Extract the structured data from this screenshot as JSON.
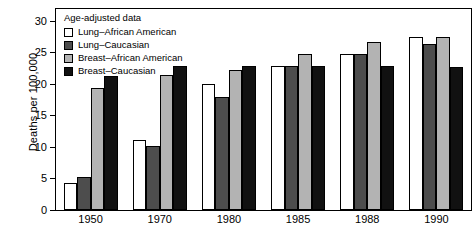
{
  "chart_data": {
    "type": "bar",
    "title": "",
    "xlabel": "",
    "ylabel": "Deaths per 100,000",
    "ylim": [
      0,
      32
    ],
    "yticks": [
      0,
      5,
      10,
      15,
      20,
      25,
      30
    ],
    "ytick_labels": [
      "0",
      "5",
      "10",
      "15",
      "20",
      "25",
      "30"
    ],
    "grid": false,
    "legend_position": "upper-left-inside",
    "legend_title": "Age-adjusted data",
    "categories": [
      "1950",
      "1970",
      "1980",
      "1985",
      "1988",
      "1990"
    ],
    "series": [
      {
        "name": "Lung–African American",
        "color": "#ffffff",
        "edge_color": "#000000",
        "values": [
          4.3,
          11.2,
          20.0,
          22.9,
          24.9,
          27.6
        ]
      },
      {
        "name": "Lung–Caucasian",
        "color": "#4d4d4d",
        "edge_color": "#000000",
        "values": [
          5.2,
          10.2,
          18.0,
          22.9,
          24.9,
          26.5
        ]
      },
      {
        "name": "Breast–African American",
        "color": "#b3b3b3",
        "edge_color": "#000000",
        "values": [
          19.4,
          21.5,
          22.3,
          24.8,
          26.8,
          27.6
        ]
      },
      {
        "name": "Breast–Caucasian",
        "color": "#111111",
        "edge_color": "#000000",
        "values": [
          21.4,
          23.0,
          22.9,
          22.9,
          23.0,
          22.8
        ]
      }
    ]
  }
}
